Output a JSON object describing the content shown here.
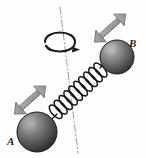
{
  "figure": {
    "kind": "physics-diagram",
    "background_color": "#fefefe"
  },
  "labels": {
    "sphere_a": "A",
    "sphere_b": "B"
  },
  "colors": {
    "sphere_dark": "#2b2b2b",
    "sphere_mid": "#6d6d6d",
    "sphere_highlight": "#c8c8c8",
    "sphere_outline": "#1a1a1a",
    "spring_stroke": "#141414",
    "axis_line": "#8f8f8f",
    "arrow_fill": "#9a9a9a",
    "arrow_outline": "#6a6a6a",
    "rotation_arrow": "#1c1c1c",
    "label_color": "#1a1a1a"
  },
  "elements": {
    "sphere_a_center": "37,132",
    "sphere_a_radius": "20",
    "sphere_b_center": "117,57",
    "sphere_b_radius": "17",
    "spring_coils": "10",
    "axis_top": "60,7",
    "axis_bottom": "78,153",
    "rotation_arrow_center": "60,45",
    "vibration_arrow_a": "double-headed diagonal arrow near sphere A",
    "vibration_arrow_b": "double-headed diagonal arrow near sphere B"
  }
}
